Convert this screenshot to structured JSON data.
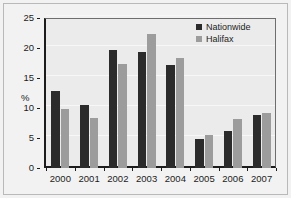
{
  "chart_data": {
    "type": "bar",
    "title": "",
    "xlabel": "",
    "ylabel": "%",
    "ylim": [
      0,
      25
    ],
    "yticks": [
      0,
      5,
      10,
      15,
      20,
      25
    ],
    "ytick_labels": [
      "0",
      "5",
      "10",
      "15",
      "20",
      "25"
    ],
    "grid": true,
    "legend_position": "top-right",
    "categories": [
      "2000",
      "2001",
      "2002",
      "2003",
      "2004",
      "2005",
      "2006",
      "2007"
    ],
    "series": [
      {
        "name": "Nationwide",
        "color": "#2b2b2b",
        "values": [
          12.8,
          10.5,
          19.7,
          19.4,
          17.1,
          4.8,
          6.1,
          8.9
        ]
      },
      {
        "name": "Halifax",
        "color": "#9c9c9c",
        "values": [
          9.8,
          8.4,
          17.4,
          22.4,
          18.4,
          5.5,
          8.1,
          9.2
        ]
      }
    ]
  },
  "colors": {
    "background": "#f2f2f2",
    "plot_background": "#ebebeb",
    "axis": "#1c1c1c",
    "gridline": "#f7f7f7",
    "border": "#b9b9b9"
  }
}
